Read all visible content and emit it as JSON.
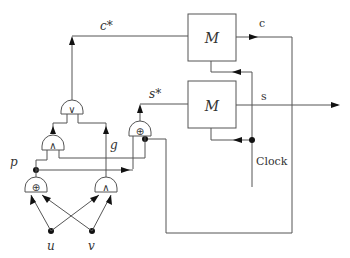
{
  "diagram": {
    "type": "circuit",
    "blocks": [
      {
        "id": "M1",
        "label": "M"
      },
      {
        "id": "M2",
        "label": "M"
      }
    ],
    "gates": [
      {
        "id": "or-gate",
        "symbol": "∨"
      },
      {
        "id": "and-gate-upper",
        "symbol": "∧"
      },
      {
        "id": "xor-gate-upper",
        "symbol": "⊕"
      },
      {
        "id": "xor-gate-lower",
        "symbol": "⊕"
      },
      {
        "id": "and-gate-lower",
        "symbol": "∧"
      }
    ],
    "labels": {
      "c_star": "c*",
      "s_star": "s*",
      "c": "c",
      "s": "s",
      "p": "p",
      "g": "g",
      "u": "u",
      "v": "v",
      "clock": "Clock"
    }
  }
}
